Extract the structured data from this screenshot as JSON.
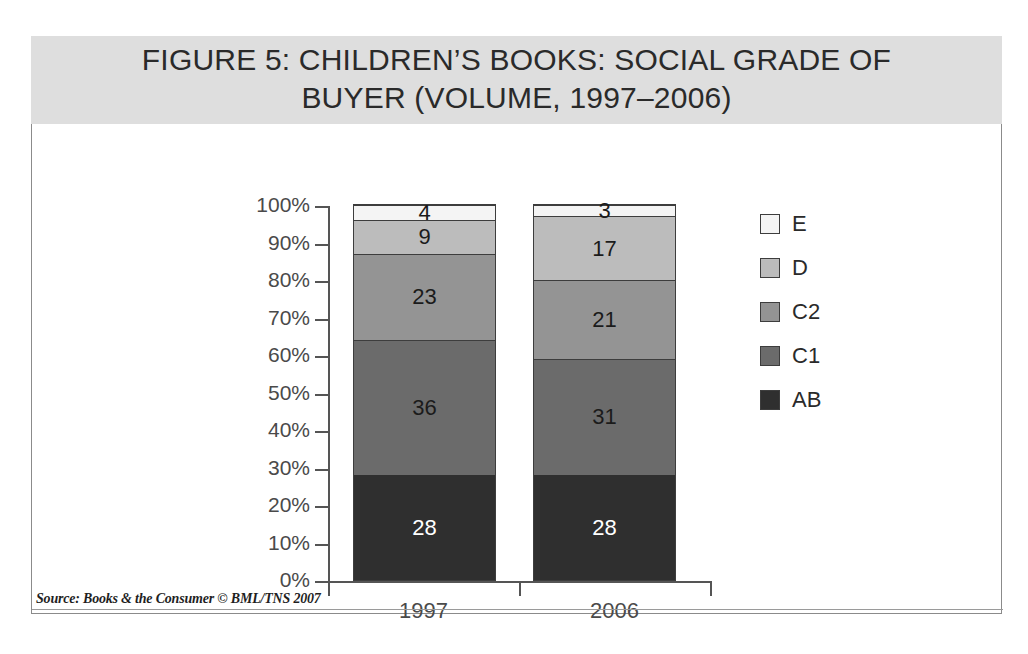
{
  "figure": {
    "title": "FIGURE 5: CHILDREN’S BOOKS: SOCIAL GRADE OF\nBUYER (VOLUME, 1997–2006)",
    "source": "Source: Books & the Consumer © BML/TNS 2007"
  },
  "chart_data": {
    "type": "bar",
    "subtype": "stacked-100-percent",
    "title": "FIGURE 5: CHILDREN’S BOOKS: SOCIAL GRADE OF BUYER (VOLUME, 1997–2006)",
    "xlabel": "",
    "ylabel": "",
    "ylim": [
      0,
      100
    ],
    "ytick_labels": [
      "0%",
      "10%",
      "20%",
      "30%",
      "40%",
      "50%",
      "60%",
      "70%",
      "80%",
      "90%",
      "100%"
    ],
    "ytick_values": [
      0,
      10,
      20,
      30,
      40,
      50,
      60,
      70,
      80,
      90,
      100
    ],
    "grid": false,
    "legend_position": "right",
    "categories": [
      "1997",
      "2006"
    ],
    "series": [
      {
        "name": "AB",
        "values": [
          28,
          28
        ],
        "color": "#2f2f2f",
        "label_color": "#ffffff"
      },
      {
        "name": "C1",
        "values": [
          36,
          31
        ],
        "color": "#6b6b6b",
        "label_color": "#1b1b1b"
      },
      {
        "name": "C2",
        "values": [
          23,
          21
        ],
        "color": "#949494",
        "label_color": "#1b1b1b"
      },
      {
        "name": "D",
        "values": [
          9,
          17
        ],
        "color": "#bcbcbc",
        "label_color": "#1b1b1b"
      },
      {
        "name": "E",
        "values": [
          4,
          3
        ],
        "color": "#f4f4f4",
        "label_color": "#1b1b1b"
      }
    ],
    "legend_entries": [
      {
        "label": "E",
        "color": "#f4f4f4"
      },
      {
        "label": "D",
        "color": "#bcbcbc"
      },
      {
        "label": "C2",
        "color": "#949494"
      },
      {
        "label": "C1",
        "color": "#6b6b6b"
      },
      {
        "label": "AB",
        "color": "#2f2f2f"
      }
    ]
  }
}
